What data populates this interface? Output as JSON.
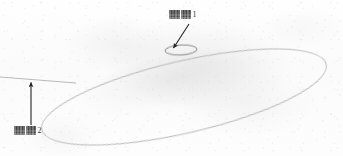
{
  "figure": {
    "medium": "photocopied / scanned paper",
    "paper_color": "#fdfdfd",
    "ink_color": "#b2b2b2",
    "annotation_color": "#2d2d2d"
  },
  "labels": [
    {
      "id": "callout-1",
      "glyph_text": "■■",
      "number": "1",
      "note": "illegible scanned CJK characters followed by reference numeral 1",
      "x": 169,
      "y": 10,
      "points_to": "small-ellipse"
    },
    {
      "id": "callout-2",
      "glyph_text": "■■",
      "number": "2",
      "note": "illegible scanned CJK characters followed by reference numeral 2",
      "x": 14,
      "y": 126,
      "points_to": "tangent-line"
    }
  ],
  "shapes": {
    "large_ellipse": {
      "name": "large-ellipse",
      "cx": 184,
      "cy": 97,
      "rx": 146,
      "ry": 36,
      "rotation_deg": -13,
      "stroke": "#b2b2b2",
      "stroke_width": 0.9,
      "fill": "none"
    },
    "small_ellipse": {
      "name": "small-ellipse",
      "cx": 181,
      "cy": 50,
      "rx": 16,
      "ry": 5,
      "rotation_deg": -3,
      "stroke": "#6f6f6f",
      "stroke_width": 0.8,
      "fill": "none"
    },
    "tangent_line": {
      "name": "tangent-line",
      "x1": 0,
      "y1": 77,
      "x2": 76,
      "y2": 83,
      "stroke": "#b2b2b2",
      "stroke_width": 0.9
    },
    "leader_arrow_1": {
      "name": "leader-arrow-1",
      "x1": 189,
      "y1": 24,
      "x2": 172,
      "y2": 50,
      "stroke": "#242424",
      "stroke_width": 1.1,
      "arrowhead": "filled-triangle"
    },
    "leader_arrow_2": {
      "name": "leader-arrow-2",
      "x1": 31,
      "y1": 126,
      "x2": 31,
      "y2": 79,
      "stroke": "#242424",
      "stroke_width": 1.1,
      "arrowhead": "filled-triangle"
    }
  }
}
